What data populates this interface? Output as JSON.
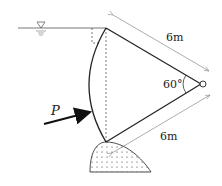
{
  "diagram": {
    "type": "radial-gate",
    "labels": {
      "upper_length": "6m",
      "lower_length": "6m",
      "angle": "60°",
      "force": "P"
    },
    "water_surface_symbol": "▽",
    "colors": {
      "line": "#222222",
      "dim": "#888888",
      "water": "#777777"
    }
  }
}
